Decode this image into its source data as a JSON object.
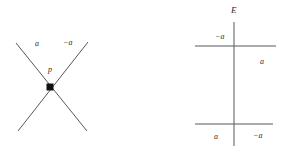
{
  "figure": {
    "background_color": "#ffffff",
    "stroke_color": "#585858",
    "label_color": "#2b2b2b",
    "panels": [
      {
        "id": "left-crossing-diagram",
        "description": "x-crossing",
        "vertex": {
          "name": "vertex-dot",
          "x": 50,
          "y": 87
        },
        "strands": [
          {
            "name": "strand-nw-se",
            "x1": 16,
            "y1": 43,
            "x2": 87,
            "y2": 131
          },
          {
            "name": "strand-ne-sw",
            "x1": 88,
            "y1": 42,
            "x2": 18,
            "y2": 131
          }
        ],
        "labels": [
          {
            "name": "label-a-upper-left",
            "text": "a",
            "x": 35,
            "y": 40
          },
          {
            "name": "label-minus-a-upper-right",
            "text": "−a",
            "x": 63,
            "y": 39
          },
          {
            "name": "label-p-vertex",
            "text": "p",
            "x": 48,
            "y": 66
          }
        ]
      },
      {
        "id": "right-ladder-diagram",
        "description": "ladder",
        "strands": [
          {
            "name": "rail-vertical",
            "x1": 234,
            "y1": 22,
            "x2": 234,
            "y2": 146
          },
          {
            "name": "rung-upper-horizontal",
            "x1": 195,
            "y1": 46,
            "x2": 276,
            "y2": 46
          },
          {
            "name": "rung-lower-horizontal",
            "x1": 195,
            "y1": 124,
            "x2": 273,
            "y2": 124
          }
        ],
        "labels": [
          {
            "name": "label-E-title",
            "text": "E",
            "x": 231,
            "y": 6,
            "title": true
          },
          {
            "name": "label-minus-a-upper",
            "text": "−a",
            "x": 215,
            "y": 33
          },
          {
            "name": "label-a-right",
            "text": "a",
            "x": 260,
            "y": 58
          },
          {
            "name": "label-a-lower-left",
            "text": "a",
            "x": 214,
            "y": 133
          },
          {
            "name": "label-minus-a-lower-right",
            "text": "−a",
            "x": 253,
            "y": 132
          }
        ]
      }
    ]
  }
}
